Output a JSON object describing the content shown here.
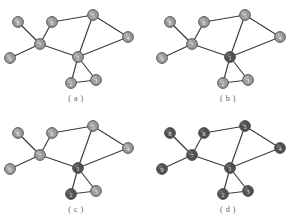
{
  "figure": {
    "panel_count": 4,
    "colors": {
      "node_light_fill": "#9a9a9a",
      "node_dark_fill": "#4f4f4f",
      "node_stroke": "#4a4a4a",
      "edge": "#3a3a3a",
      "label_light": "#f2f2f2",
      "label_dark": "#e8e8e8",
      "caption": "#5a5a5a",
      "background": "#ffffff"
    },
    "node_radius": 5.4,
    "nodes": [
      {
        "id": "1",
        "x": 78,
        "y": 57
      },
      {
        "id": "2",
        "x": 71,
        "y": 83
      },
      {
        "id": "3",
        "x": 96,
        "y": 80
      },
      {
        "id": "4",
        "x": 128,
        "y": 37
      },
      {
        "id": "5",
        "x": 93,
        "y": 15
      },
      {
        "id": "6",
        "x": 52,
        "y": 22
      },
      {
        "id": "7",
        "x": 40,
        "y": 44
      },
      {
        "id": "8",
        "x": 18,
        "y": 22
      },
      {
        "id": "9",
        "x": 10,
        "y": 58
      }
    ],
    "edges": [
      [
        "1",
        "2"
      ],
      [
        "1",
        "3"
      ],
      [
        "2",
        "3"
      ],
      [
        "1",
        "4"
      ],
      [
        "1",
        "5"
      ],
      [
        "1",
        "7"
      ],
      [
        "4",
        "5"
      ],
      [
        "5",
        "6"
      ],
      [
        "6",
        "7"
      ],
      [
        "7",
        "8"
      ],
      [
        "7",
        "9"
      ]
    ],
    "panels": [
      {
        "key": "a",
        "caption": "( a )",
        "origin_x": 0,
        "origin_y": 0,
        "dark_nodes": []
      },
      {
        "key": "b",
        "caption": "( b )",
        "origin_x": 152,
        "origin_y": 0,
        "dark_nodes": [
          "1"
        ]
      },
      {
        "key": "c",
        "caption": "( c )",
        "origin_x": 0,
        "origin_y": 111,
        "dark_nodes": [
          "1",
          "2"
        ]
      },
      {
        "key": "d",
        "caption": "( d )",
        "origin_x": 152,
        "origin_y": 111,
        "dark_nodes": [
          "1",
          "2",
          "3",
          "4",
          "5",
          "6",
          "7",
          "8",
          "9"
        ]
      }
    ]
  }
}
